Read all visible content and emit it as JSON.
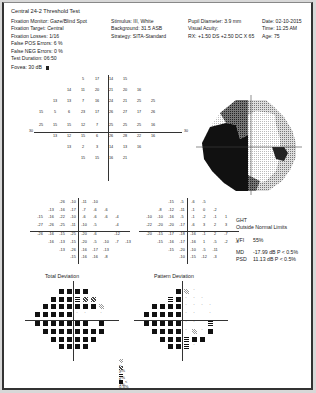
{
  "header": {
    "title": "Central 24-2 Threshold Test",
    "col1": [
      "Fixation Monitor: Gaze/Blind Spot",
      "Fixation Target: Central",
      "Fixation Losses: 1/16",
      "False POS Errors: 6 %",
      "False NEG Errors: 0 %",
      "Test Duration: 06:50"
    ],
    "col2": [
      "Stimulus: III, White",
      "Background: 31.5 ASB",
      "Strategy: SITA-Standard"
    ],
    "col3": [
      "Pupil Diameter: 3.9 mm",
      "Visual Acuity:",
      "RX: +1.50 DS  +2.50 DC  X 65"
    ],
    "col4": [
      "Date: 02-10-2015",
      "Time: 11:25 AM",
      "Age: 75"
    ],
    "fovea": "Fovea: 30 dB"
  },
  "threshold": {
    "axis_label_left": "30",
    "axis_label_right": "30",
    "rows": [
      [
        "",
        "",
        "",
        "5",
        "17",
        "14",
        "15",
        "",
        "",
        ""
      ],
      [
        "",
        "",
        "14",
        "11",
        "20",
        "21",
        "20",
        "16",
        "",
        ""
      ],
      [
        "",
        "13",
        "13",
        "7",
        "16",
        "24",
        "21",
        "25",
        "25",
        ""
      ],
      [
        "15",
        "5",
        "6",
        "23",
        "17",
        "26",
        "27",
        "17",
        "26",
        ""
      ],
      [
        "25",
        "15",
        "15",
        "12",
        "7",
        "25",
        "25",
        "25",
        "16",
        ""
      ],
      [
        "",
        "13",
        "12",
        "15",
        "6",
        "26",
        "28",
        "22",
        "16",
        ""
      ],
      [
        "",
        "",
        "13",
        "2",
        "3",
        "14",
        "13",
        "16",
        "",
        ""
      ],
      [
        "",
        "",
        "",
        "15",
        "15",
        "16",
        "21",
        "",
        "",
        ""
      ]
    ]
  },
  "total_deviation_values": {
    "rows": [
      [
        "",
        "",
        "-26",
        "-10",
        "-11",
        "-10",
        "",
        ""
      ],
      [
        "",
        "-13",
        "-16",
        "-17",
        "-7",
        "-6",
        "-6",
        ""
      ],
      [
        "-15",
        "-16",
        "-22",
        "-10",
        "-6",
        "-6",
        "-6",
        "-4"
      ],
      [
        "-27",
        "-26",
        "-25",
        "-11",
        "-10",
        "-5",
        "",
        "-4"
      ],
      [
        "-26",
        "-16",
        "-15",
        "-25",
        "-20",
        "-6",
        "",
        "-12"
      ],
      [
        "",
        "-16",
        "-13",
        "-15",
        "-20",
        "-5",
        "-10",
        "-7",
        "-13"
      ],
      [
        "",
        "",
        "-13",
        "-26",
        "-16",
        "-17",
        "-13",
        ""
      ],
      [
        "",
        "",
        "",
        "-15",
        "-16",
        "-16",
        "-8",
        ""
      ]
    ]
  },
  "pattern_deviation_values": {
    "rows": [
      [
        "",
        "",
        "-15",
        "-5",
        "-6",
        "-5",
        "",
        ""
      ],
      [
        "",
        "-8",
        "-12",
        "-11",
        "-1",
        "0",
        "-2",
        ""
      ],
      [
        "-10",
        "-10",
        "-16",
        "-5",
        "-1",
        "-2",
        "-1",
        "1"
      ],
      [
        "-22",
        "-20",
        "-20",
        "-17",
        "-6",
        "3",
        "2",
        "3"
      ],
      [
        "-20",
        "-15",
        "-17",
        "-18",
        "-16",
        "-1",
        "2",
        "-7"
      ],
      [
        "",
        "-15",
        "-16",
        "-17",
        "-16",
        "1",
        "-5",
        "-2",
        "-6"
      ],
      [
        "",
        "",
        "-15",
        "-20",
        "-10",
        "-5",
        "-11",
        ""
      ],
      [
        "",
        "",
        "",
        "-10",
        "-15",
        "-12",
        "-3",
        ""
      ]
    ]
  },
  "indices": {
    "ght_label": "GHT",
    "ght_value": "Outside Normal Limits",
    "vfi_label": "VFI",
    "vfi_value": "55%",
    "md_label": "MD",
    "md_value": "-17.99 dB P < 0.5%",
    "psd_label": "PSD",
    "psd_value": "11.13 dB P < 0.5%"
  },
  "plots": {
    "total_deviation_title": "Total Deviation",
    "pattern_deviation_title": "Pattern Deviation",
    "total_deviation_symbols": [
      [
        "",
        "",
        "",
        "B",
        "B",
        "B",
        "B",
        "",
        "",
        ""
      ],
      [
        "",
        "",
        "B",
        "B",
        "B",
        "D",
        "M",
        "M",
        "",
        ""
      ],
      [
        "",
        "B",
        "B",
        "B",
        "B",
        "B",
        "B",
        "B",
        "L",
        ""
      ],
      [
        "B",
        "B",
        "B",
        "B",
        "B",
        "d",
        "d",
        "",
        "d",
        ""
      ],
      [
        "B",
        "B",
        "B",
        "B",
        "B",
        "B",
        "B",
        "",
        "B",
        ""
      ],
      [
        "",
        "B",
        "B",
        "B",
        "B",
        "B",
        "B",
        "B",
        "B",
        ""
      ],
      [
        "",
        "",
        "B",
        "B",
        "B",
        "B",
        "B",
        "B",
        "",
        ""
      ],
      [
        "",
        "",
        "",
        "B",
        "B",
        "B",
        "B",
        "",
        "",
        ""
      ]
    ],
    "pattern_deviation_symbols": [
      [
        "",
        "",
        "",
        "",
        "B",
        "L",
        "d",
        "",
        "",
        ""
      ],
      [
        "",
        "",
        "",
        "D",
        "B",
        "d",
        "d",
        "d",
        "",
        ""
      ],
      [
        "",
        "B",
        "B",
        "B",
        "B",
        "d",
        "d",
        "d",
        "d",
        ""
      ],
      [
        "B",
        "B",
        "B",
        "B",
        "B",
        "d",
        "d",
        "",
        "d",
        ""
      ],
      [
        "B",
        "B",
        "B",
        "B",
        "B",
        "d",
        "d",
        "",
        "D",
        ""
      ],
      [
        "",
        "B",
        "B",
        "B",
        "B",
        "d",
        "L",
        "d",
        "B",
        ""
      ],
      [
        "",
        "",
        "B",
        "B",
        "B",
        "D",
        "B",
        "B",
        "",
        ""
      ],
      [
        "",
        "",
        "",
        "B",
        "B",
        "D",
        "d",
        "",
        "",
        ""
      ]
    ]
  },
  "legend": [
    {
      "symbol": "light",
      "label": "< 5%"
    },
    {
      "symbol": "mid",
      "label": "< 2%"
    },
    {
      "symbol": "dark",
      "label": "< 1%"
    },
    {
      "symbol": "black",
      "label": "< 0.5%"
    }
  ]
}
